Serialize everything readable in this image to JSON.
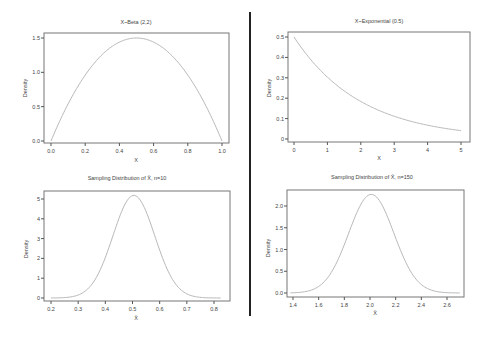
{
  "chart_data": [
    {
      "type": "line",
      "title": "X~Beta (2,2)",
      "xlabel": "X",
      "ylabel": "Density",
      "xlim": [
        0.0,
        1.0
      ],
      "ylim": [
        0.0,
        1.5
      ],
      "xticks": [
        "0.0",
        "0.2",
        "0.4",
        "0.6",
        "0.8",
        "1.0"
      ],
      "yticks": [
        "0.0",
        "0.5",
        "1.0",
        "1.5"
      ],
      "grid": false,
      "series": [
        {
          "name": "Beta(2,2) density",
          "x": [
            0.0,
            0.1,
            0.2,
            0.3,
            0.4,
            0.5,
            0.6,
            0.7,
            0.8,
            0.9,
            1.0
          ],
          "y": [
            0.0,
            0.54,
            0.96,
            1.26,
            1.44,
            1.5,
            1.44,
            1.26,
            0.96,
            0.54,
            0.0
          ]
        }
      ],
      "layout": {
        "frame": [
          44,
          33,
          229,
          143
        ],
        "x0px": 51,
        "x1px": 222,
        "y0px": 141,
        "y1px": 38,
        "y1val": 1.5,
        "fn": "beta22"
      }
    },
    {
      "type": "line",
      "title": "X~Exponential (0.5)",
      "xlabel": "X",
      "ylabel": "Density",
      "xlim": [
        0,
        5
      ],
      "ylim": [
        0,
        0.5
      ],
      "xticks": [
        "0",
        "1",
        "2",
        "3",
        "4",
        "5"
      ],
      "yticks": [
        "0",
        "0.1",
        "0.2",
        "0.3",
        "0.4",
        "0.5"
      ],
      "grid": false,
      "series": [
        {
          "name": "Exponential(0.5) density",
          "x": [
            0,
            1,
            2,
            3,
            4,
            5
          ],
          "y": [
            0.5,
            0.303,
            0.184,
            0.112,
            0.068,
            0.041
          ]
        }
      ],
      "layout": {
        "frame": [
          288,
          32,
          470,
          142
        ],
        "x0px": 294,
        "x1px": 461,
        "y0px": 139,
        "y1px": 37,
        "y1val": 0.5,
        "fn": "exp05"
      }
    },
    {
      "type": "line",
      "title": "Sampling Distribution of X̄, n=10",
      "xlabel": "X̄",
      "ylabel": "Density",
      "xlim": [
        0.2,
        0.82
      ],
      "ylim": [
        0,
        5.2
      ],
      "xticks": [
        "0.2",
        "0.3",
        "0.4",
        "0.5",
        "0.6",
        "0.7",
        "0.8"
      ],
      "yticks": [
        "0",
        "1",
        "2",
        "3",
        "4",
        "5"
      ],
      "grid": false,
      "series": [
        {
          "name": "Sampling density (n=10)",
          "x": [
            0.2,
            0.3,
            0.4,
            0.45,
            0.5,
            0.55,
            0.6,
            0.7,
            0.82
          ],
          "y": [
            0.0,
            0.2,
            2.2,
            4.2,
            5.2,
            4.2,
            2.2,
            0.2,
            0.0
          ]
        }
      ],
      "layout": {
        "frame": [
          44,
          191,
          230,
          301
        ],
        "x0px": 51,
        "x1px": 214,
        "xmin": 0.2,
        "xmax": 0.8,
        "y0px": 298,
        "y1px": 199,
        "y1val": 5,
        "fn": "norm",
        "mu": 0.505,
        "sd": 0.077,
        "range": [
          0.2,
          0.825
        ]
      }
    },
    {
      "type": "line",
      "title": "Sampling Distribution of X̄, n=150",
      "xlabel": "X̄",
      "ylabel": "Density",
      "xlim": [
        1.38,
        2.7
      ],
      "ylim": [
        0,
        2.27
      ],
      "xticks": [
        "1.4",
        "1.6",
        "1.8",
        "2.0",
        "2.2",
        "2.4",
        "2.6"
      ],
      "yticks": [
        "0.0",
        "0.5",
        "1.0",
        "1.5",
        "2.0"
      ],
      "grid": false,
      "series": [
        {
          "name": "Sampling density (n=150)",
          "x": [
            1.38,
            1.6,
            1.8,
            1.9,
            2.0,
            2.1,
            2.2,
            2.4,
            2.7
          ],
          "y": [
            0.02,
            0.15,
            1.15,
            1.95,
            2.27,
            1.95,
            1.15,
            0.15,
            0.02
          ]
        }
      ],
      "layout": {
        "frame": [
          287,
          190,
          464,
          297
        ],
        "x0px": 293,
        "x1px": 447,
        "xmin": 1.4,
        "xmax": 2.6,
        "y0px": 293,
        "y1px": 206,
        "y1val": 2.0,
        "fn": "norm",
        "mu": 2.01,
        "sd": 0.176,
        "range": [
          1.38,
          2.7
        ]
      }
    }
  ]
}
